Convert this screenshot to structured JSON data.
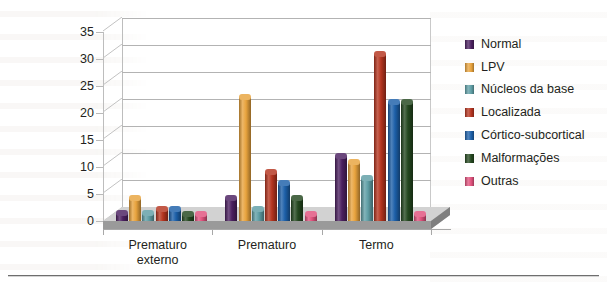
{
  "chart_data": {
    "type": "bar",
    "title": "",
    "subtitle": "",
    "xlabel": "",
    "ylabel": "",
    "ylim": [
      0,
      35
    ],
    "ytick_step": 5,
    "yticks": [
      35,
      30,
      25,
      20,
      15,
      10,
      5,
      0
    ],
    "grid": true,
    "grid_axis": "y",
    "legend_position": "right",
    "style_3d": true,
    "categories": [
      "Prematuro externo",
      "Prematuro",
      "Termo"
    ],
    "category_lines": [
      [
        "Prematuro",
        "externo"
      ],
      [
        "Prematuro"
      ],
      [
        "Termo"
      ]
    ],
    "series": [
      {
        "name": "Normal",
        "color": "#4b2060",
        "values": [
          1.5,
          4.3,
          12
        ]
      },
      {
        "name": "LPV",
        "color": "#e8a33d",
        "values": [
          4.3,
          23,
          11
        ]
      },
      {
        "name": "Núcleos da base",
        "color": "#5f9ea5",
        "values": [
          1.5,
          2.3,
          8
        ]
      },
      {
        "name": "Localizada",
        "color": "#b5341f",
        "values": [
          2.3,
          9,
          31
        ]
      },
      {
        "name": "Córtico-subcortical",
        "color": "#1c5fa8",
        "values": [
          2.3,
          7,
          22
        ]
      },
      {
        "name": "Malformações",
        "color": "#24471f",
        "values": [
          1.3,
          4.3,
          22
        ]
      },
      {
        "name": "Outras",
        "color": "#e0517c",
        "values": [
          1.3,
          1.3,
          1.3
        ]
      }
    ]
  },
  "legend": {
    "items": [
      {
        "label": "Normal"
      },
      {
        "label": "LPV"
      },
      {
        "label": "Núcleos da base"
      },
      {
        "label": "Localizada"
      },
      {
        "label": "Córtico-subcortical"
      },
      {
        "label": "Malformações"
      },
      {
        "label": "Outras"
      }
    ]
  },
  "axis": {
    "y_ticks": [
      "35",
      "30",
      "25",
      "20",
      "15",
      "10",
      "5",
      "0"
    ],
    "x_categories": [
      {
        "line1": "Prematuro",
        "line2": "externo"
      },
      {
        "line1": "Prematuro",
        "line2": ""
      },
      {
        "line1": "Termo",
        "line2": ""
      }
    ]
  },
  "colors": {
    "gridline": "#b3b3b3",
    "axis": "#a8a8a8",
    "floor_top": "#cfcfcf",
    "floor_side": "#8e8e8e",
    "text": "#231f20",
    "page_background": "#ffffff"
  }
}
